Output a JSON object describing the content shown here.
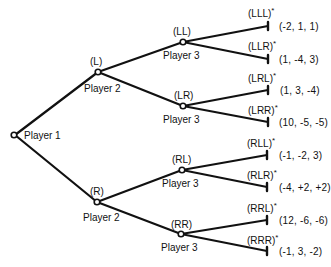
{
  "diagram": {
    "type": "extensive-form game tree",
    "root": {
      "label": "Player 1"
    },
    "level1": [
      {
        "history": "(L)",
        "player": "Player 2"
      },
      {
        "history": "(R)",
        "player": "Player 2"
      }
    ],
    "level2": [
      {
        "history": "(LL)",
        "player": "Player 3"
      },
      {
        "history": "(LR)",
        "player": "Player 3"
      },
      {
        "history": "(RL)",
        "player": "Player 3"
      },
      {
        "history": "(RR)",
        "player": "Player 3"
      }
    ],
    "terminals": [
      {
        "history": "(LLL)",
        "mark": "*",
        "payoff": "(-2, 1, 1)"
      },
      {
        "history": "(LLR)",
        "mark": "*",
        "payoff": "(1, -4, 3)"
      },
      {
        "history": "(LRL)",
        "mark": "*",
        "payoff": "(1, 3, -4)"
      },
      {
        "history": "(LRR)",
        "mark": "*",
        "payoff": "(10, -5, -5)"
      },
      {
        "history": "(RLL)",
        "mark": "*",
        "payoff": "(-1, -2, 3)"
      },
      {
        "history": "(RLR)",
        "mark": "*",
        "payoff": "(-4, +2, +2)"
      },
      {
        "history": "(RRL)",
        "mark": "*",
        "payoff": "(12, -6, -6)"
      },
      {
        "history": "(RRR)",
        "mark": "*",
        "payoff": "(-1, 3, -2)"
      }
    ]
  }
}
